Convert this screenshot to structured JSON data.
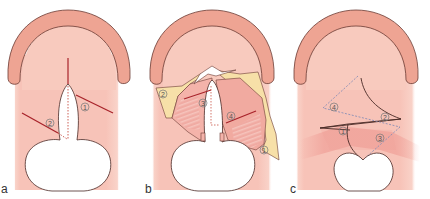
{
  "figure": {
    "colors": {
      "tissue": "#f7c3b8",
      "tissue_light": "#fbdcd3",
      "ridge": "#eea493",
      "outline": "#6b3b34",
      "incision": "#a8232a",
      "flap_yellow": "#f7e0a8",
      "muscle": "#f0a8a0",
      "dashed_blue": "#8a8fb5",
      "cleft": "#ffffff"
    },
    "panels": [
      {
        "id": "a",
        "label": "a",
        "markers": [
          {
            "number": "1"
          },
          {
            "number": "2"
          }
        ]
      },
      {
        "id": "b",
        "label": "b",
        "markers": [
          {
            "number": "1"
          },
          {
            "number": "2"
          },
          {
            "number": "3"
          },
          {
            "number": "4"
          }
        ]
      },
      {
        "id": "c",
        "label": "c",
        "markers": [
          {
            "number": "1"
          },
          {
            "number": "2"
          },
          {
            "number": "3"
          },
          {
            "number": "4"
          }
        ]
      }
    ]
  }
}
